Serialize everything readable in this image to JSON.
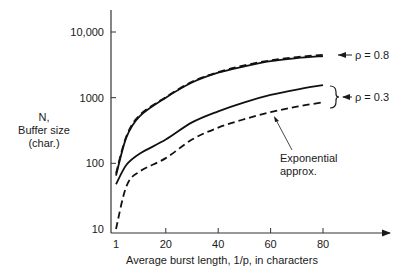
{
  "chart_data": {
    "type": "line",
    "title": "",
    "xlabel": "Average burst length, 1/p, in characters",
    "ylabel_lines": [
      "N,",
      "Buffer size",
      "(char.)"
    ],
    "yscale": "log",
    "xlim": [
      1,
      95
    ],
    "ylim": [
      10,
      20000
    ],
    "x_ticks": [
      1,
      20,
      40,
      60,
      80
    ],
    "x_tick_labels": [
      "1",
      "20",
      "40",
      "60",
      "80"
    ],
    "y_ticks": [
      10,
      100,
      1000,
      10000
    ],
    "y_tick_labels": [
      "10",
      "100",
      "1000",
      "10,000"
    ],
    "grid": false,
    "x": [
      1,
      5,
      10,
      20,
      30,
      40,
      50,
      60,
      70,
      80
    ],
    "series": [
      {
        "name": "rho = 0.8 (exact)",
        "style": "solid",
        "values": [
          65,
          250,
          520,
          1000,
          1700,
          2400,
          3000,
          3600,
          4000,
          4300
        ]
      },
      {
        "name": "rho = 0.8 (exponential approx.)",
        "style": "dashed",
        "values": [
          70,
          260,
          540,
          1020,
          1750,
          2450,
          3100,
          3700,
          4150,
          4500
        ]
      },
      {
        "name": "rho = 0.3 (exact)",
        "style": "solid",
        "values": [
          48,
          95,
          140,
          230,
          420,
          620,
          850,
          1100,
          1330,
          1550
        ]
      },
      {
        "name": "rho = 0.3 (exponential approx.)",
        "style": "dashed",
        "values": [
          10,
          45,
          75,
          120,
          230,
          350,
          470,
          600,
          730,
          850
        ]
      }
    ],
    "annotations": [
      {
        "text": "ρ = 0.8",
        "points_to": "rho = 0.8 curves"
      },
      {
        "text": "ρ = 0.3",
        "points_to": "rho = 0.3 curves (bracket)"
      },
      {
        "text_lines": [
          "Exponential",
          "approx."
        ],
        "points_to": "rho = 0.3 (exponential approx.)"
      }
    ]
  }
}
